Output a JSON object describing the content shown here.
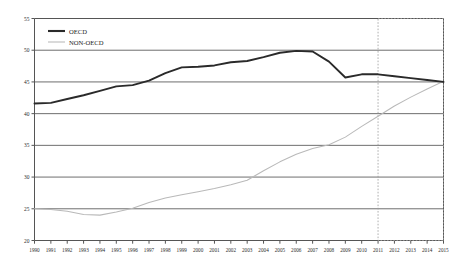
{
  "chart_data": {
    "type": "line",
    "title": "",
    "xlabel": "",
    "ylabel": "",
    "ylim": [
      20,
      55
    ],
    "ytick_step": 5,
    "yticks": [
      20,
      25,
      30,
      35,
      40,
      45,
      50,
      55
    ],
    "grid": true,
    "legend_position": "top-left",
    "x": [
      1990,
      1991,
      1992,
      1993,
      1994,
      1995,
      1996,
      1997,
      1998,
      1999,
      2000,
      2001,
      2002,
      2003,
      2004,
      2005,
      2006,
      2007,
      2008,
      2009,
      2010,
      2011,
      2012,
      2013,
      2014,
      2015
    ],
    "xticklabels": [
      "1990",
      "1991",
      "1992",
      "1993",
      "1994",
      "1995",
      "1996",
      "1997",
      "1998",
      "1999",
      "2000",
      "2001",
      "2002",
      "2003",
      "2004",
      "2005",
      "2006",
      "2007",
      "2008",
      "2009",
      "2010",
      "2011",
      "2012",
      "2013",
      "2014",
      "2015"
    ],
    "yticklabels": [
      "20",
      "25",
      "30",
      "35",
      "40",
      "45",
      "50",
      "55"
    ],
    "series": [
      {
        "name": "OECD",
        "color": "#2a2a2a",
        "values": [
          41.6,
          41.7,
          42.3,
          42.9,
          43.6,
          44.3,
          44.5,
          45.2,
          46.4,
          47.3,
          47.4,
          47.6,
          48.1,
          48.3,
          48.9,
          49.6,
          49.9,
          49.8,
          48.2,
          45.7,
          46.2,
          46.2,
          45.9,
          45.6,
          45.3,
          45.0
        ]
      },
      {
        "name": "NON-OECD",
        "color": "#b9b9b9",
        "values": [
          25.0,
          24.9,
          24.6,
          24.1,
          24.0,
          24.5,
          25.1,
          26.0,
          26.7,
          27.2,
          27.7,
          28.2,
          28.8,
          29.5,
          31.0,
          32.4,
          33.6,
          34.5,
          35.1,
          36.3,
          38.0,
          39.6,
          41.2,
          42.6,
          43.9,
          45.1
        ]
      }
    ],
    "annotations": {
      "forecast_region": {
        "label": "",
        "start_year": 2011,
        "end_year": 2015
      }
    }
  },
  "legend": {
    "items": [
      {
        "label": "OECD",
        "style": "thick-dark-line"
      },
      {
        "label": "NON-OECD",
        "style": "thin-gray-line"
      }
    ]
  }
}
